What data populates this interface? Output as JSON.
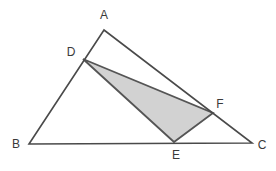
{
  "figure": {
    "width": 276,
    "height": 171,
    "background_color": "#ffffff"
  },
  "style": {
    "outline_stroke": "#4a4a4a",
    "outline_stroke_width": 1.6,
    "inner_stroke": "#555555",
    "inner_stroke_width": 1.8,
    "shade_fill": "#d2d2d2",
    "label_color": "#3a3a3a",
    "label_font_size": 12
  },
  "points": {
    "A": {
      "label": "A",
      "x": 104,
      "y": 30,
      "label_x": 104,
      "label_y": 16
    },
    "B": {
      "label": "B",
      "x": 29,
      "y": 144,
      "label_x": 16,
      "label_y": 145
    },
    "C": {
      "label": "C",
      "x": 252,
      "y": 143,
      "label_x": 262,
      "label_y": 146
    },
    "D": {
      "label": "D",
      "x": 83,
      "y": 59,
      "label_x": 71,
      "label_y": 53
    },
    "E": {
      "label": "E",
      "x": 174,
      "y": 142,
      "label_x": 176,
      "label_y": 156
    },
    "F": {
      "label": "F",
      "x": 213,
      "y": 113,
      "label_x": 220,
      "label_y": 105
    }
  },
  "paths": {
    "outer_triangle": "M 104,30 L 29,144 L 252,143 Z",
    "shaded_triangle": "M 83,59 L 213,113 L 174,142 Z"
  },
  "segments": [
    {
      "name": "AB",
      "from": "A",
      "to": "B",
      "note": "contains point D"
    },
    {
      "name": "BC",
      "from": "B",
      "to": "C",
      "note": "contains point E"
    },
    {
      "name": "AC",
      "from": "A",
      "to": "C",
      "note": "contains point F"
    },
    {
      "name": "DF",
      "from": "D",
      "to": "F",
      "note": "top edge of shaded triangle"
    },
    {
      "name": "FE",
      "from": "F",
      "to": "E",
      "note": "right edge of shaded triangle"
    },
    {
      "name": "ED",
      "from": "E",
      "to": "D",
      "note": "left edge of shaded triangle"
    }
  ]
}
